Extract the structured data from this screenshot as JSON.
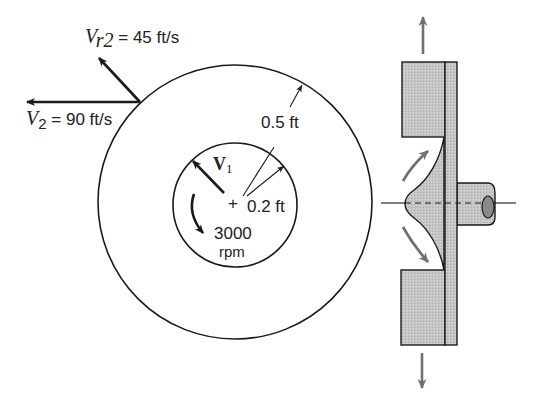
{
  "figure": {
    "colors": {
      "line": "#1a1a1a",
      "fill_gray": "#c4c4c4",
      "flow_arrow": "#707070"
    }
  },
  "plan_view": {
    "outer_radius_label": "0.5 ft",
    "inner_radius_label": "0.2 ft",
    "rotation_speed_value": "3000",
    "rotation_speed_unit": "rpm",
    "center_mark": "+",
    "inlet_velocity_label": "V",
    "inlet_velocity_sub": "1",
    "exit_radial_velocity": {
      "symbol": "V",
      "subscript": "r2",
      "equals_value": " = 45 ft/s"
    },
    "exit_absolute_velocity": {
      "symbol": "V",
      "subscript": "2",
      "equals_value": " = 90 ft/s"
    }
  },
  "side_view": {
    "flow_direction_top": "up-arrow",
    "flow_direction_bottom": "down-arrow",
    "shaft": "shaft",
    "centerline": "dashed-centerline"
  }
}
